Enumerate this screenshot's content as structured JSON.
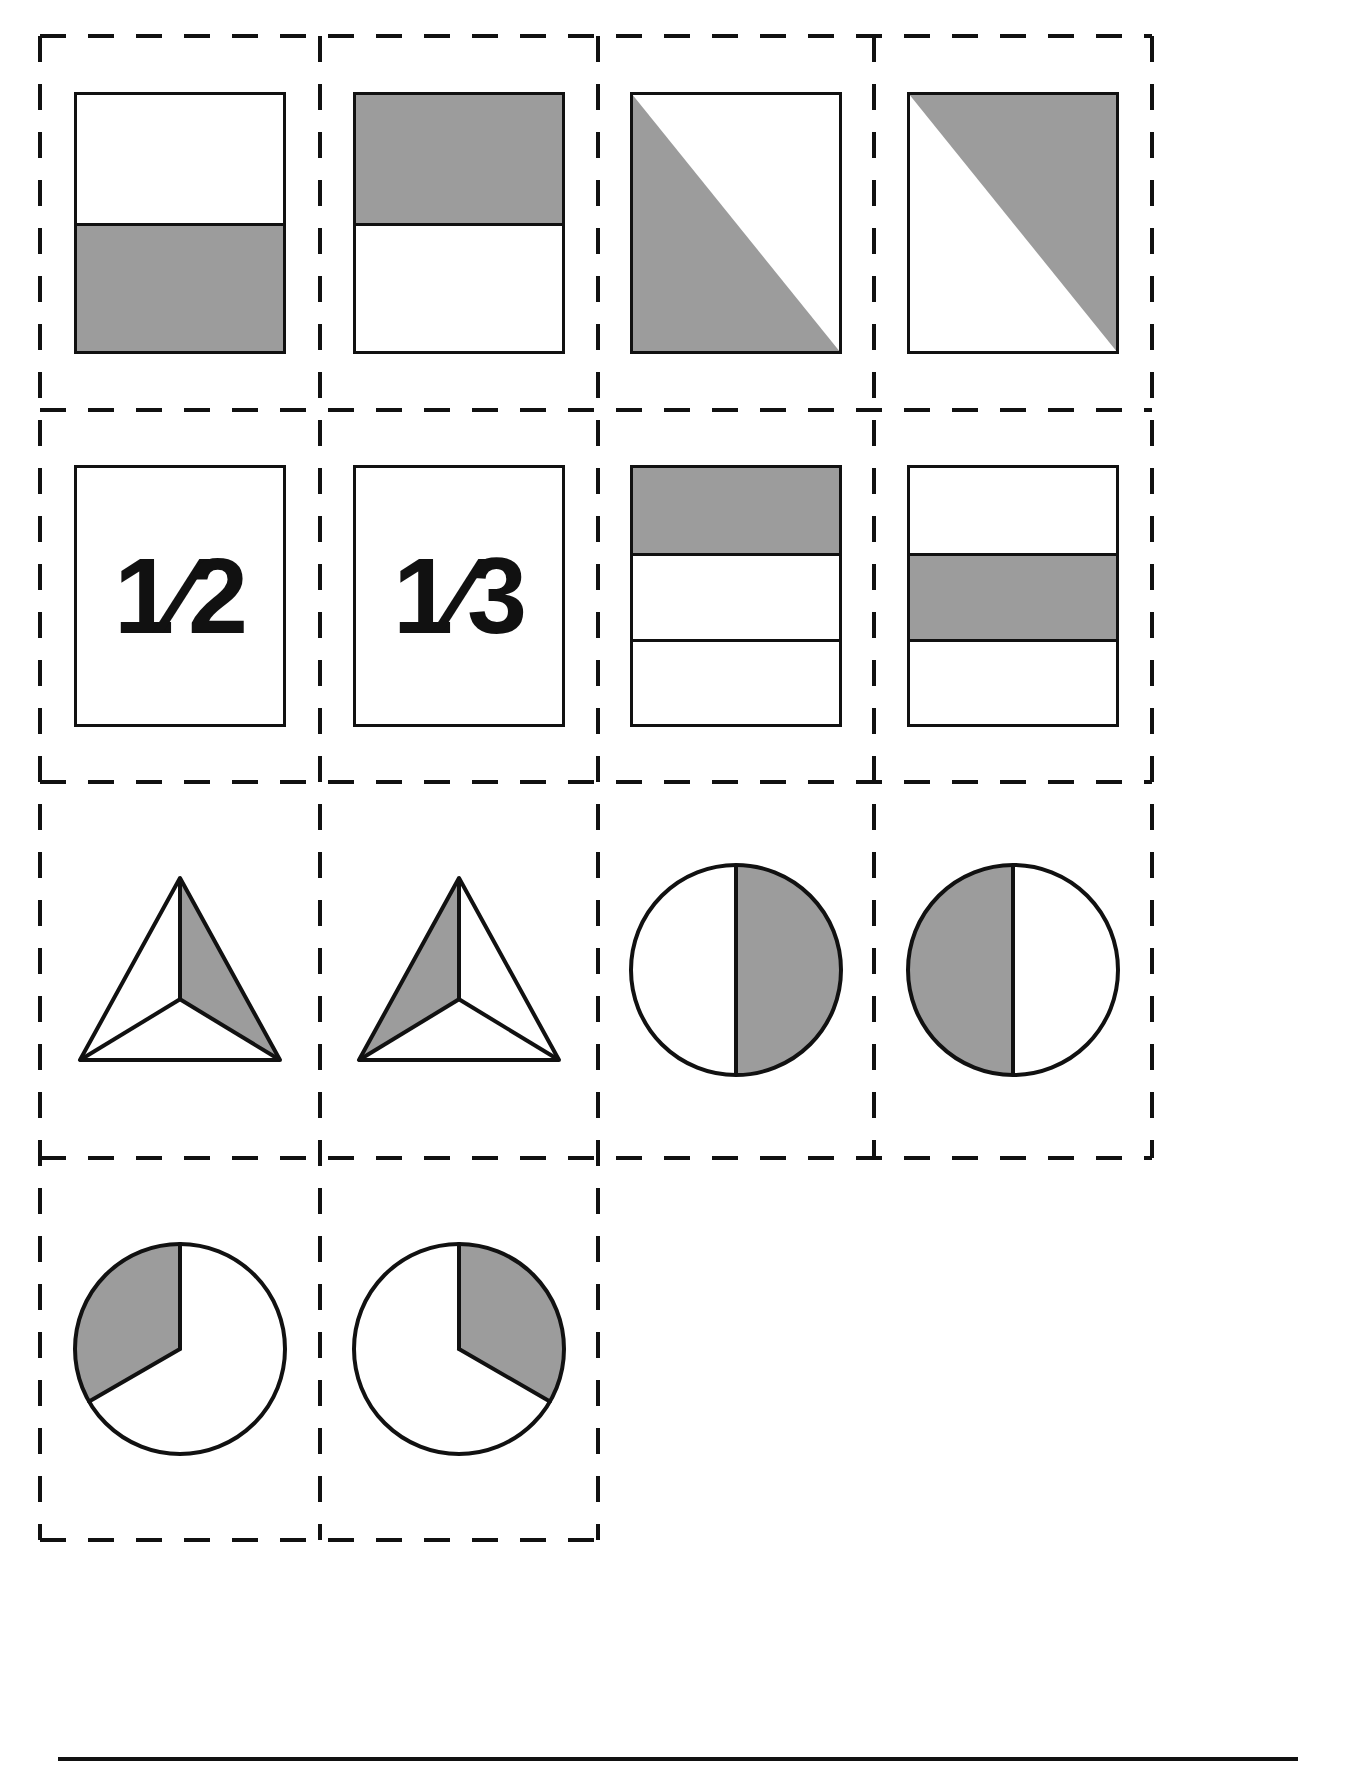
{
  "document": {
    "type": "fraction-cut-out-cards-worksheet",
    "page_width": 1350,
    "page_height": 1774,
    "background_color": "#ffffff",
    "line_color": "#111111",
    "shade_color": "#9c9c9c",
    "cut_line_style": "dashed",
    "bottom_rule": "solid"
  },
  "grid": {
    "columns": 4,
    "rows": 4,
    "row4_filled_cells": 2,
    "column_left_edges": [
      40,
      320,
      598,
      874
    ],
    "column_right_edge": 1152,
    "row_top_edges": [
      36,
      410,
      782,
      1158
    ],
    "row_bottom_edge": 1540
  },
  "cards": [
    {
      "index": 1,
      "row": 1,
      "col": 1,
      "figure": "rectangle",
      "label": "half-rectangle-bottom-shaded",
      "parts": 2,
      "shaded_parts": 1,
      "fraction": "1/2",
      "orientation": "horizontal-bands",
      "shaded_band_indices": [
        1
      ]
    },
    {
      "index": 2,
      "row": 1,
      "col": 2,
      "figure": "rectangle",
      "label": "half-rectangle-top-shaded",
      "parts": 2,
      "shaded_parts": 1,
      "fraction": "1/2",
      "orientation": "horizontal-bands",
      "shaded_band_indices": [
        0
      ]
    },
    {
      "index": 3,
      "row": 1,
      "col": 3,
      "figure": "square-diagonal",
      "label": "half-square-lower-left-triangle-shaded",
      "parts": 2,
      "shaded_parts": 1,
      "fraction": "1/2",
      "diagonal": "top-left-to-bottom-right",
      "shaded_side": "lower-left"
    },
    {
      "index": 4,
      "row": 1,
      "col": 4,
      "figure": "square-diagonal",
      "label": "half-square-upper-right-triangle-shaded",
      "parts": 2,
      "shaded_parts": 1,
      "fraction": "1/2",
      "diagonal": "top-left-to-bottom-right",
      "shaded_side": "upper-right"
    },
    {
      "index": 5,
      "row": 2,
      "col": 1,
      "figure": "fraction-text",
      "label": "fraction-label-one-half",
      "text": "1⁄2",
      "numerator": "1",
      "denominator": "2",
      "fraction": "1/2"
    },
    {
      "index": 6,
      "row": 2,
      "col": 2,
      "figure": "fraction-text",
      "label": "fraction-label-one-third",
      "text": "1⁄3",
      "numerator": "1",
      "denominator": "3",
      "fraction": "1/3"
    },
    {
      "index": 7,
      "row": 2,
      "col": 3,
      "figure": "rectangle",
      "label": "thirds-rectangle-top-band-shaded",
      "parts": 3,
      "shaded_parts": 1,
      "fraction": "1/3",
      "orientation": "horizontal-bands",
      "shaded_band_indices": [
        0
      ]
    },
    {
      "index": 8,
      "row": 2,
      "col": 4,
      "figure": "rectangle",
      "label": "thirds-rectangle-middle-band-shaded",
      "parts": 3,
      "shaded_parts": 1,
      "fraction": "1/3",
      "orientation": "horizontal-bands",
      "shaded_band_indices": [
        1
      ]
    },
    {
      "index": 9,
      "row": 3,
      "col": 1,
      "figure": "triangle-thirds",
      "label": "thirds-triangle-right-region-shaded",
      "parts": 3,
      "shaded_parts": 1,
      "fraction": "1/3",
      "shaded_region": "right"
    },
    {
      "index": 10,
      "row": 3,
      "col": 2,
      "figure": "triangle-thirds",
      "label": "thirds-triangle-left-region-shaded",
      "parts": 3,
      "shaded_parts": 1,
      "fraction": "1/3",
      "shaded_region": "left"
    },
    {
      "index": 11,
      "row": 3,
      "col": 3,
      "figure": "circle-halves",
      "label": "half-circle-right-shaded",
      "parts": 2,
      "shaded_parts": 1,
      "fraction": "1/2",
      "shaded_side": "right"
    },
    {
      "index": 12,
      "row": 3,
      "col": 4,
      "figure": "circle-halves",
      "label": "half-circle-left-shaded",
      "parts": 2,
      "shaded_parts": 1,
      "fraction": "1/2",
      "shaded_side": "left"
    },
    {
      "index": 13,
      "row": 4,
      "col": 1,
      "figure": "circle-thirds",
      "label": "third-circle-upper-left-sector-shaded",
      "parts": 3,
      "shaded_parts": 1,
      "fraction": "1/3",
      "sector_degrees": 120,
      "sector_start_degrees": 0,
      "sector_direction": "counterclockwise"
    },
    {
      "index": 14,
      "row": 4,
      "col": 2,
      "figure": "circle-thirds",
      "label": "third-circle-upper-right-sector-shaded",
      "parts": 3,
      "shaded_parts": 1,
      "fraction": "1/3",
      "sector_degrees": 120,
      "sector_start_degrees": 0,
      "sector_direction": "clockwise"
    }
  ]
}
